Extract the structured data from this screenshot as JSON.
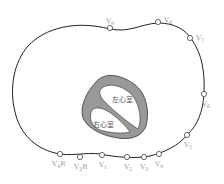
{
  "diagram": {
    "colors": {
      "outline": "#222222",
      "heart_wall": "#999999",
      "label": "#9a9a9a"
    },
    "chambers": {
      "left_ventricle": "左心室",
      "right_ventricle": "右心室"
    },
    "electrodes": [
      {
        "id": "V9",
        "main": "V",
        "sub": "9",
        "suffix": "",
        "cx": 110,
        "cy": 28,
        "lx": 106,
        "ly": 23
      },
      {
        "id": "V8",
        "main": "V",
        "sub": "8",
        "suffix": "",
        "cx": 158,
        "cy": 22,
        "lx": 164,
        "ly": 22
      },
      {
        "id": "V7",
        "main": "V",
        "sub": "7",
        "suffix": "",
        "cx": 190,
        "cy": 38,
        "lx": 196,
        "ly": 40
      },
      {
        "id": "V6",
        "main": "V",
        "sub": "6",
        "suffix": "",
        "cx": 204,
        "cy": 94,
        "lx": 202,
        "ly": 106
      },
      {
        "id": "V5",
        "main": "V",
        "sub": "5",
        "suffix": "",
        "cx": 187,
        "cy": 135,
        "lx": 184,
        "ly": 147
      },
      {
        "id": "V4",
        "main": "V",
        "sub": "4",
        "suffix": "",
        "cx": 159,
        "cy": 154,
        "lx": 155,
        "ly": 166
      },
      {
        "id": "V3",
        "main": "V",
        "sub": "3",
        "suffix": "",
        "cx": 144,
        "cy": 157,
        "lx": 140,
        "ly": 169
      },
      {
        "id": "V2",
        "main": "V",
        "sub": "2",
        "suffix": "",
        "cx": 127,
        "cy": 157,
        "lx": 124,
        "ly": 169
      },
      {
        "id": "V1",
        "main": "V",
        "sub": "1",
        "suffix": "",
        "cx": 102,
        "cy": 155,
        "lx": 99,
        "ly": 167
      },
      {
        "id": "V3R",
        "main": "V",
        "sub": "3",
        "suffix": "R",
        "cx": 80,
        "cy": 157,
        "lx": 74,
        "ly": 169
      },
      {
        "id": "V4R",
        "main": "V",
        "sub": "4",
        "suffix": "R",
        "cx": 60,
        "cy": 154,
        "lx": 52,
        "ly": 166
      }
    ]
  }
}
